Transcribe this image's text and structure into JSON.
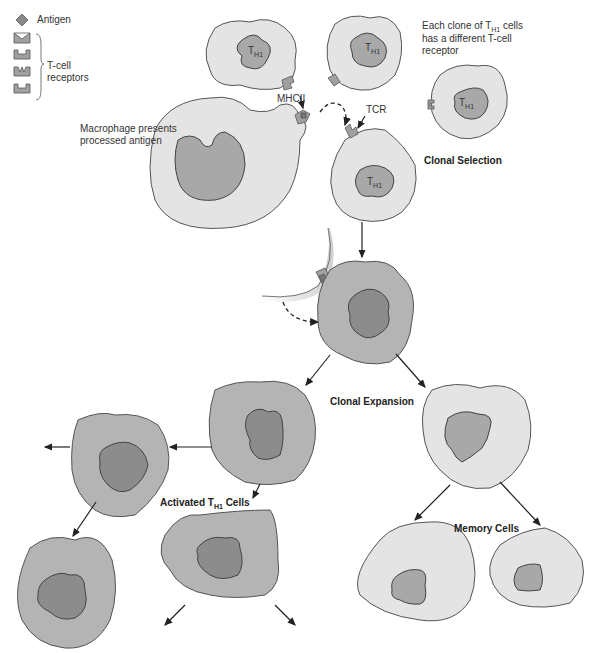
{
  "legend": {
    "antigen_label": "Antigen",
    "receptors_label_line1": "T-cell",
    "receptors_label_line2": "receptors",
    "receptor_shapes": [
      "v-notch",
      "square-notch",
      "w-notch",
      "square-notch"
    ]
  },
  "labels": {
    "clone_note_prefix": "Each clone of T",
    "clone_note_sub": "H1",
    "clone_note_suffix": " cells",
    "clone_note_line2": "has a different T-cell",
    "clone_note_line3": "receptor",
    "mhcii": "MHCII",
    "tcr": "TCR",
    "macrophage_line1": "Macrophage presents",
    "macrophage_line2": "processed antigen",
    "clonal_selection": "Clonal Selection",
    "clonal_expansion": "Clonal Expansion",
    "activated_prefix": "Activated T",
    "activated_sub": "H1",
    "activated_suffix": " Cells",
    "memory_cells": "Memory Cells",
    "th1_main": "T",
    "th1_sub": "H1"
  },
  "colors": {
    "light_cell": "#e4e4e4",
    "mid_cell": "#b4b4b4",
    "nucleus_mid": "#a8a8a8",
    "nucleus_dark": "#8c8c8c",
    "outline": "#555555"
  }
}
